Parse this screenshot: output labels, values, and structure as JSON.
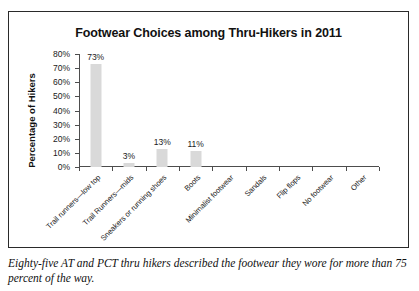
{
  "chart_data": {
    "type": "bar",
    "title": "Footwear Choices among Thru-Hikers in 2011",
    "xlabel": "",
    "ylabel": "Percentage of Hikers",
    "ylim": [
      0,
      80
    ],
    "grid": false,
    "legend": false,
    "categories": [
      "Trail runners—low top",
      "Trail Runners—mids",
      "Sneakers or running shoes",
      "Boots",
      "Minimalist footwear",
      "Sandals",
      "Flip flops",
      "No footwear",
      "Other"
    ],
    "values": [
      73,
      3,
      13,
      11,
      0,
      0,
      0,
      0,
      0
    ],
    "value_labels": [
      "73%",
      "3%",
      "13%",
      "11%",
      "",
      "",
      "",
      "",
      ""
    ],
    "ytick_labels": [
      "80%",
      "70%",
      "60%",
      "50%",
      "40%",
      "30%",
      "20%",
      "10%",
      "0%"
    ],
    "ytick_values": [
      80,
      70,
      60,
      50,
      40,
      30,
      20,
      10,
      0
    ],
    "bar_color": "#d9d9d9",
    "axis_color": "#4d4d4d",
    "text_color": "#1a1a1a"
  },
  "caption": {
    "text": "Eighty-five AT and PCT thru hikers described the footwear they wore for more than 75 percent of the way."
  }
}
